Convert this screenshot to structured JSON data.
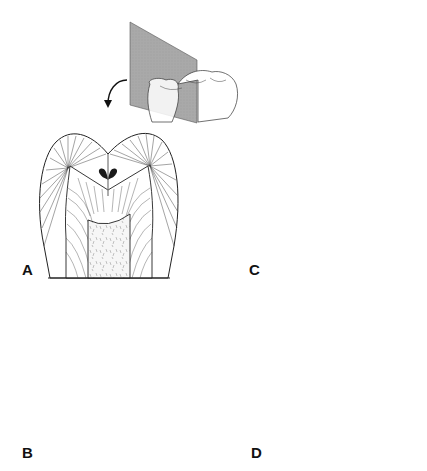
{
  "figure": {
    "inset": {
      "description": "Buccolingual sectioning plane through a molar crown; arrow indicates viewing direction",
      "plane_color": "#a9a9a9"
    },
    "panels": [
      {
        "id": "A",
        "label": "A",
        "stage": "initial pit-and-fissure lesion, two small dark foci at fissure walls",
        "x": 40,
        "y": 135
      },
      {
        "id": "C",
        "label": "C",
        "stage": "lesion spreading along enamel rods to DEJ with dentin involvement",
        "x": 265,
        "y": 135
      },
      {
        "id": "B",
        "label": "B",
        "stage": "enlarged enamel lesion foci with early dentinal changes",
        "x": 40,
        "y": 305
      },
      {
        "id": "D",
        "label": "D",
        "stage": "cavitated lesion with stippled carious dentin and reactive zone",
        "x": 265,
        "y": 305
      }
    ],
    "colors": {
      "line": "#222222",
      "lesion_dark": "#1a1a1a",
      "pulp_fill": "#f4f4f4",
      "stipple": "#9a9a9a"
    }
  }
}
